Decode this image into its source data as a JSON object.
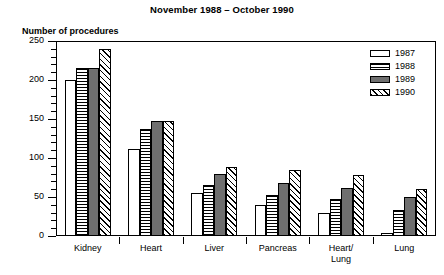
{
  "chart_data": {
    "type": "bar",
    "title": "November 1988 – October 1990",
    "xlabel": "",
    "ylabel": "Number of procedures",
    "ylim": [
      0,
      250
    ],
    "ytick_step": 50,
    "yminor_step": 10,
    "ytick_labels": [
      "0",
      "50",
      "100",
      "150",
      "200",
      "250"
    ],
    "grid": false,
    "legend_position": "top-right",
    "categories": [
      "Kidney",
      "Heart",
      "Liver",
      "Pancreas",
      "Heart/\nLung",
      "Lung"
    ],
    "series": [
      {
        "name": "1987",
        "fill": "white",
        "values": [
          200,
          112,
          55,
          40,
          30,
          4
        ]
      },
      {
        "name": "1988",
        "fill": "horizontal-hatch",
        "values": [
          215,
          137,
          65,
          52,
          48,
          33
        ]
      },
      {
        "name": "1989",
        "fill": "solid-dark-gray",
        "values": [
          215,
          148,
          80,
          68,
          62,
          50
        ]
      },
      {
        "name": "1990",
        "fill": "diagonal-hatch",
        "values": [
          240,
          148,
          88,
          85,
          78,
          60
        ]
      }
    ]
  },
  "legend": {
    "items": [
      {
        "label": "1987"
      },
      {
        "label": "1988"
      },
      {
        "label": "1989"
      },
      {
        "label": "1990"
      }
    ]
  },
  "colors": {
    "axis": "#000000",
    "series_1989": "#6f6f6f",
    "background": "#ffffff"
  }
}
